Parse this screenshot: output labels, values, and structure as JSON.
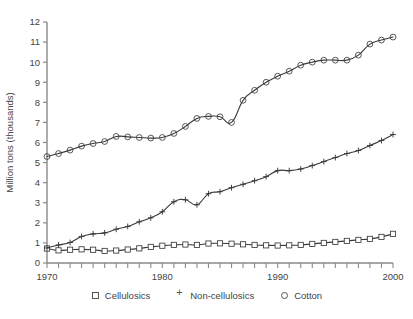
{
  "chart_data": {
    "type": "line",
    "title": "",
    "xlabel": "",
    "ylabel": "Million tons (thousands)",
    "xlim": [
      1970,
      2000
    ],
    "ylim": [
      0,
      12
    ],
    "xticks": [
      1970,
      1980,
      1990,
      2000
    ],
    "xtick_labels": [
      "1970",
      "1980",
      "1990",
      "2000"
    ],
    "yticks": [
      0,
      1,
      2,
      3,
      4,
      5,
      6,
      7,
      8,
      9,
      10,
      11,
      12
    ],
    "ytick_labels": [
      "0",
      "1",
      "2",
      "3",
      "4",
      "5",
      "6",
      "7",
      "8",
      "9",
      "10",
      "11",
      "12"
    ],
    "grid": false,
    "legend_position": "bottom",
    "x": [
      1970,
      1971,
      1972,
      1973,
      1974,
      1975,
      1976,
      1977,
      1978,
      1979,
      1980,
      1981,
      1982,
      1983,
      1984,
      1985,
      1986,
      1987,
      1988,
      1989,
      1990,
      1991,
      1992,
      1993,
      1994,
      1995,
      1996,
      1997,
      1998,
      1999,
      2000
    ],
    "series": [
      {
        "name": "Cellulosics",
        "marker": "square",
        "values": [
          0.72,
          0.63,
          0.66,
          0.68,
          0.66,
          0.6,
          0.62,
          0.67,
          0.73,
          0.8,
          0.86,
          0.9,
          0.92,
          0.9,
          0.97,
          0.98,
          0.96,
          0.93,
          0.9,
          0.88,
          0.87,
          0.88,
          0.9,
          0.95,
          1.0,
          1.05,
          1.1,
          1.15,
          1.2,
          1.3,
          1.45
        ]
      },
      {
        "name": "Non-cellulosics",
        "marker": "plus",
        "values": [
          0.75,
          0.9,
          1.02,
          1.32,
          1.45,
          1.5,
          1.68,
          1.82,
          2.05,
          2.25,
          2.55,
          3.05,
          3.15,
          2.9,
          3.45,
          3.55,
          3.75,
          3.92,
          4.1,
          4.3,
          4.6,
          4.6,
          4.68,
          4.85,
          5.05,
          5.25,
          5.45,
          5.6,
          5.85,
          6.1,
          6.4
        ]
      },
      {
        "name": "Cotton",
        "marker": "circle",
        "values": [
          5.3,
          5.45,
          5.62,
          5.82,
          5.95,
          6.05,
          6.3,
          6.28,
          6.25,
          6.22,
          6.25,
          6.45,
          6.8,
          7.2,
          7.3,
          7.28,
          7.0,
          8.1,
          8.6,
          9.0,
          9.3,
          9.55,
          9.85,
          10.0,
          10.1,
          10.1,
          10.1,
          10.35,
          10.9,
          11.1,
          11.25
        ]
      }
    ]
  },
  "legend": {
    "items": [
      {
        "label": "Cellulosics",
        "marker": "square"
      },
      {
        "label": "Non-cellulosics",
        "marker": "plus"
      },
      {
        "label": "Cotton",
        "marker": "circle"
      }
    ]
  },
  "colors": {
    "line": "#3a3a3a",
    "axis": "#8a8a8a",
    "text": "#444444"
  }
}
